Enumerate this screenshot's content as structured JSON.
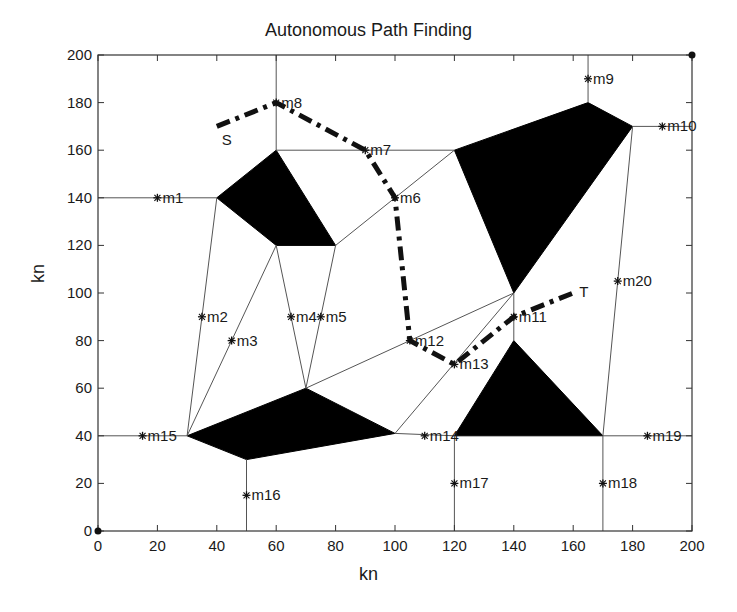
{
  "chart_data": {
    "type": "line",
    "title": "Autonomous Path Finding",
    "xlabel": "kn",
    "ylabel": "kn",
    "xlim": [
      0,
      200
    ],
    "ylim": [
      0,
      200
    ],
    "xticks": [
      0,
      20,
      40,
      60,
      80,
      100,
      120,
      140,
      160,
      180,
      200
    ],
    "yticks": [
      0,
      20,
      40,
      60,
      80,
      100,
      120,
      140,
      160,
      180,
      200
    ],
    "grid": false,
    "legend": null,
    "corner_markers": [
      [
        0,
        0
      ],
      [
        200,
        200
      ]
    ],
    "obstacles": [
      {
        "name": "obstacle-1",
        "vertices": [
          [
            40,
            140
          ],
          [
            60,
            160
          ],
          [
            80,
            120
          ],
          [
            60,
            120
          ]
        ]
      },
      {
        "name": "obstacle-2",
        "vertices": [
          [
            120,
            160
          ],
          [
            165,
            180
          ],
          [
            180,
            170
          ],
          [
            140,
            100
          ]
        ]
      },
      {
        "name": "obstacle-3",
        "vertices": [
          [
            30,
            40
          ],
          [
            70,
            60
          ],
          [
            100,
            41
          ],
          [
            50,
            30
          ]
        ]
      },
      {
        "name": "obstacle-4",
        "vertices": [
          [
            120,
            40
          ],
          [
            140,
            80
          ],
          [
            170,
            40
          ]
        ]
      }
    ],
    "roadmap_edges": [
      [
        [
          0,
          140
        ],
        [
          40,
          140
        ]
      ],
      [
        [
          60,
          160
        ],
        [
          60,
          200
        ]
      ],
      [
        [
          60,
          160
        ],
        [
          120,
          160
        ]
      ],
      [
        [
          80,
          120
        ],
        [
          120,
          160
        ]
      ],
      [
        [
          165,
          180
        ],
        [
          165,
          200
        ]
      ],
      [
        [
          180,
          170
        ],
        [
          200,
          170
        ]
      ],
      [
        [
          40,
          140
        ],
        [
          30,
          40
        ]
      ],
      [
        [
          60,
          120
        ],
        [
          30,
          40
        ]
      ],
      [
        [
          60,
          120
        ],
        [
          70,
          60
        ]
      ],
      [
        [
          80,
          120
        ],
        [
          70,
          60
        ]
      ],
      [
        [
          70,
          60
        ],
        [
          140,
          100
        ]
      ],
      [
        [
          100,
          41
        ],
        [
          140,
          100
        ]
      ],
      [
        [
          140,
          100
        ],
        [
          140,
          80
        ]
      ],
      [
        [
          180,
          170
        ],
        [
          170,
          40
        ]
      ],
      [
        [
          0,
          40
        ],
        [
          30,
          40
        ]
      ],
      [
        [
          50,
          30
        ],
        [
          50,
          0
        ]
      ],
      [
        [
          100,
          41
        ],
        [
          120,
          40
        ]
      ],
      [
        [
          170,
          40
        ],
        [
          200,
          40
        ]
      ],
      [
        [
          120,
          40
        ],
        [
          120,
          0
        ]
      ],
      [
        [
          170,
          40
        ],
        [
          170,
          0
        ]
      ]
    ],
    "milestones": [
      {
        "label": "m1",
        "x": 20,
        "y": 140
      },
      {
        "label": "m2",
        "x": 35,
        "y": 90
      },
      {
        "label": "m3",
        "x": 45,
        "y": 80
      },
      {
        "label": "m4",
        "x": 65,
        "y": 90
      },
      {
        "label": "m5",
        "x": 75,
        "y": 90
      },
      {
        "label": "m6",
        "x": 100,
        "y": 140
      },
      {
        "label": "m7",
        "x": 90,
        "y": 160
      },
      {
        "label": "m8",
        "x": 60,
        "y": 180
      },
      {
        "label": "m9",
        "x": 165,
        "y": 190
      },
      {
        "label": "m10",
        "x": 190,
        "y": 170
      },
      {
        "label": "m11",
        "x": 140,
        "y": 90
      },
      {
        "label": "m12",
        "x": 105,
        "y": 80
      },
      {
        "label": "m13",
        "x": 120,
        "y": 70
      },
      {
        "label": "m14",
        "x": 110,
        "y": 40
      },
      {
        "label": "m15",
        "x": 15,
        "y": 40
      },
      {
        "label": "m16",
        "x": 50,
        "y": 15
      },
      {
        "label": "m17",
        "x": 120,
        "y": 20
      },
      {
        "label": "m18",
        "x": 170,
        "y": 20
      },
      {
        "label": "m19",
        "x": 185,
        "y": 40
      },
      {
        "label": "m20",
        "x": 175,
        "y": 105
      }
    ],
    "path": {
      "style": "dash-dot",
      "color": "#111111",
      "points": [
        [
          40,
          170
        ],
        [
          60,
          180
        ],
        [
          90,
          160
        ],
        [
          100,
          140
        ],
        [
          105,
          80
        ],
        [
          120,
          70
        ],
        [
          140,
          90
        ],
        [
          160,
          100
        ]
      ]
    },
    "start": {
      "label": "S",
      "x": 40,
      "y": 170
    },
    "target": {
      "label": "T",
      "x": 160,
      "y": 100
    }
  },
  "colors": {
    "axis": "#333333",
    "edge": "#555555",
    "obstacle": "#000000",
    "path": "#111111",
    "text": "#1a1a1a"
  }
}
